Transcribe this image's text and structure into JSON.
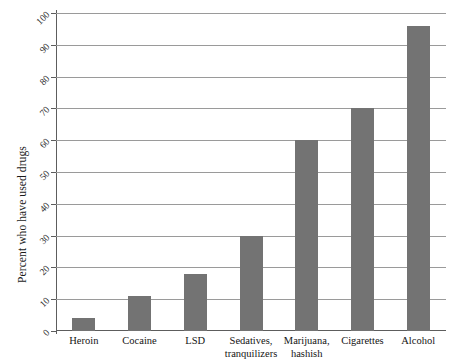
{
  "chart_data": {
    "type": "bar",
    "title": "",
    "xlabel": "",
    "ylabel": "Percent who have used drugs",
    "categories": [
      "Heroin",
      "Cocaine",
      "LSD",
      "Sedatives,\ntranquilizers",
      "Marijuana,\nhashish",
      "Cigarettes",
      "Alcohol"
    ],
    "values": [
      4,
      11,
      18,
      30,
      60,
      70,
      96
    ],
    "ylim": [
      0,
      100
    ],
    "yticks": [
      0,
      10,
      20,
      30,
      40,
      50,
      60,
      70,
      80,
      90,
      100
    ],
    "ytick_labels": [
      "0",
      "10",
      "20",
      "30",
      "40",
      "50",
      "60",
      "70",
      "80",
      "90",
      "100"
    ],
    "grid": "horizontal",
    "legend": "none",
    "bar_color": "#737373",
    "gridline_color": "#9a9a9a",
    "axis_color": "#5d5d5d"
  }
}
